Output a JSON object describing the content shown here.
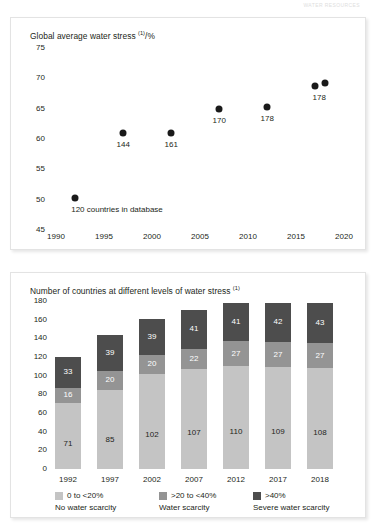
{
  "page": {
    "running_header": "WATER RESOURCES"
  },
  "charts": {
    "top": {
      "title_main": "Global average water stress ",
      "title_sup": "(1)",
      "title_tail": "/%",
      "y_ticks": [
        "75",
        "70",
        "65",
        "60",
        "55",
        "50",
        "45"
      ],
      "x_ticks": [
        "1990",
        "1995",
        "2000",
        "2005",
        "2010",
        "2015",
        "2020"
      ],
      "point_labels": [
        "144",
        "161",
        "170",
        "178",
        "178"
      ],
      "note": "120 countries in database"
    },
    "bottom": {
      "title_main": "Number of countries at different levels of water stress ",
      "title_sup": "(1)",
      "y_ticks": [
        "180",
        "160",
        "140",
        "120",
        "100",
        "80",
        "60",
        "40",
        "20",
        "0"
      ],
      "legend": [
        {
          "range": "0 to <20%",
          "name": "No water scarcity",
          "color": "#c4c4c4"
        },
        {
          "range": ">20 to <40%",
          "name": "Water scarcity",
          "color": "#949494"
        },
        {
          "range": ">40%",
          "name": "Severe water scarcity",
          "color": "#4d4d4d"
        }
      ]
    }
  },
  "chart_data": [
    {
      "type": "scatter",
      "title": "Global average water stress (1)/%",
      "xlabel": "",
      "ylabel": "Global average water stress (1)/%",
      "xlim": [
        1990,
        2020
      ],
      "ylim": [
        45,
        75
      ],
      "x_ticks": [
        1990,
        1995,
        2000,
        2005,
        2010,
        2015,
        2020
      ],
      "y_ticks": [
        45,
        50,
        55,
        60,
        65,
        70,
        75
      ],
      "grid": false,
      "legend": "none",
      "marker_color": "#1a1a1a",
      "points": [
        {
          "x": 1992,
          "y": 50.2,
          "label": "",
          "note": "120 countries in database"
        },
        {
          "x": 1997,
          "y": 61.0,
          "label": "144"
        },
        {
          "x": 2002,
          "y": 61.0,
          "label": "161"
        },
        {
          "x": 2007,
          "y": 64.9,
          "label": "170"
        },
        {
          "x": 2012,
          "y": 65.2,
          "label": "178"
        },
        {
          "x": 2017,
          "y": 68.8,
          "label": "178"
        },
        {
          "x": 2018,
          "y": 69.2,
          "label": ""
        }
      ],
      "annotations": [
        "Point labels give the number of countries in the database for that year.",
        "120 countries in database"
      ]
    },
    {
      "type": "bar",
      "subtype": "stacked",
      "title": "Number of countries at different levels of water stress (1)",
      "xlabel": "",
      "ylabel": "Number of countries",
      "ylim": [
        0,
        180
      ],
      "y_ticks": [
        0,
        20,
        40,
        60,
        80,
        100,
        120,
        140,
        160,
        180
      ],
      "grid": false,
      "legend": "bottom",
      "categories": [
        "1992",
        "1997",
        "2002",
        "2007",
        "2012",
        "2017",
        "2018"
      ],
      "series": [
        {
          "name": "0 to <20%",
          "sublabel": "No water scarcity",
          "color": "#c4c4c4",
          "values": [
            71,
            85,
            102,
            107,
            110,
            109,
            108
          ]
        },
        {
          "name": ">20 to <40%",
          "sublabel": "Water scarcity",
          "color": "#949494",
          "values": [
            16,
            20,
            20,
            22,
            27,
            27,
            27
          ]
        },
        {
          "name": ">40%",
          "sublabel": "Severe water scarcity",
          "color": "#4d4d4d",
          "values": [
            33,
            39,
            39,
            41,
            41,
            42,
            43
          ]
        }
      ],
      "totals": [
        120,
        144,
        161,
        170,
        178,
        178,
        178
      ]
    }
  ]
}
